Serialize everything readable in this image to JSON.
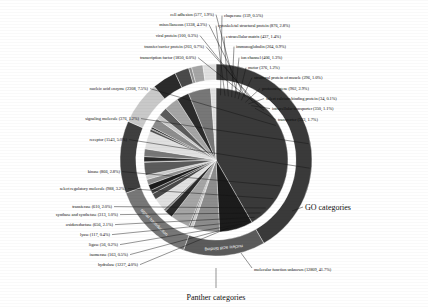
{
  "figure": {
    "title": "",
    "inner_ring_caption": "Panther categories",
    "outer_ring_caption": "GO categories",
    "unknown_caption": "molecular function unknown (12809, 41.7%)"
  },
  "chart_data": {
    "type": "pie",
    "title": "",
    "subtitle": "",
    "xlabel": "",
    "ylabel": "",
    "legend_position": "callout-labels",
    "grid": false,
    "rings": [
      {
        "name": "Panther categories",
        "radius_inner": 0,
        "radius_outer": 96,
        "note": "inner pie - Panther molecular function categories"
      },
      {
        "name": "GO categories",
        "radius_inner": 104,
        "radius_outer": 126,
        "note": "outer ring - Gene Ontology roll-up categories"
      }
    ],
    "categories": [
      "molecular function unknown",
      "nucleic acid enzyme",
      "transcription factor",
      "transfer/carrier protein",
      "viral protein",
      "miscellaneous",
      "cell adhesion",
      "chaperone",
      "cytoskeletal structural protein",
      "extracellular matrix",
      "immunoglobulin",
      "ion channel",
      "motor",
      "structural protein of muscle",
      "protooncogene",
      "select calcium binding protein",
      "intracellular transporter",
      "transporter",
      "hydrolase",
      "isomerase",
      "ligase",
      "lyase",
      "oxidoreductase",
      "synthase and synthetase",
      "transferase",
      "select regulatory molecule",
      "kinase",
      "receptor",
      "signaling molecule"
    ],
    "values": [
      12809,
      2308,
      1850,
      203,
      100,
      1338,
      577,
      159,
      876,
      437,
      264,
      406,
      376,
      296,
      902,
      34,
      350,
      533,
      1227,
      163,
      56,
      117,
      656,
      313,
      610,
      988,
      866,
      1543,
      376
    ],
    "percents": [
      41.7,
      7.5,
      6.0,
      0.7,
      0.3,
      4.3,
      1.9,
      0.5,
      2.8,
      1.4,
      0.9,
      1.3,
      1.2,
      1.0,
      2.9,
      0.1,
      1.1,
      1.7,
      4.0,
      0.5,
      0.2,
      0.4,
      2.1,
      1.0,
      2.0,
      3.2,
      2.8,
      5.0,
      1.2
    ],
    "total": 30733,
    "outer_ring_segments": [
      {
        "label": "molecular function unknown",
        "percent": 41.7
      },
      {
        "label": "nucleic acid binding",
        "percent": 13.8
      },
      {
        "label": "signal transduction",
        "percent": 13.9
      },
      {
        "label": "enzyme",
        "percent": 12.2
      },
      {
        "label": "structural molecule",
        "percent": 7.3
      },
      {
        "label": "transporter",
        "percent": 4.1
      },
      {
        "label": "defense/immunity",
        "percent": 2.4
      },
      {
        "label": "chaperone",
        "percent": 0.5
      },
      {
        "label": "cell adhesion",
        "percent": 1.9
      },
      {
        "label": "miscellaneous",
        "percent": 2.2
      }
    ]
  },
  "labels": {
    "left": [
      {
        "id": "cell-adhesion",
        "text": "cell adhesion (577, 1.9%)"
      },
      {
        "id": "miscellaneous",
        "text": "miscellaneous (1338, 4.3%)"
      },
      {
        "id": "viral-protein",
        "text": "viral protein (100, 0.3%)"
      },
      {
        "id": "transfer-carrier-protein",
        "text": "transfer/carrier protein (203, 0.7%)"
      },
      {
        "id": "transcription-factor",
        "text": "transcription factor (1850, 6.0%)"
      },
      {
        "id": "nucleic-acid-enzyme",
        "text": "nucleic acid enzyme (2308, 7.5%)"
      },
      {
        "id": "signaling-molecule",
        "text": "signaling molecule (376, 1.2%)"
      },
      {
        "id": "receptor",
        "text": "receptor (1543, 5.0%)"
      },
      {
        "id": "kinase",
        "text": "kinase (866, 2.8%)"
      },
      {
        "id": "select-regulatory-molecule",
        "text": "select regulatory molecule (988, 3.2%)"
      },
      {
        "id": "transferase",
        "text": "transferase (610, 2.0%)"
      },
      {
        "id": "synthase-and-synthetase",
        "text": "synthase and synthetase (313, 1.0%)"
      },
      {
        "id": "oxidoreductase",
        "text": "oxidoreductase (656, 2.1%)"
      },
      {
        "id": "lyase",
        "text": "lyase (117, 0.4%)"
      },
      {
        "id": "ligase",
        "text": "ligase (56, 0.2%)"
      },
      {
        "id": "isomerase",
        "text": "isomerase (163, 0.5%)"
      },
      {
        "id": "hydrolase",
        "text": "hydrolase (1227, 4.0%)"
      }
    ],
    "right": [
      {
        "id": "chaperone",
        "text": "chaperone (159, 0.5%)"
      },
      {
        "id": "cytoskeletal-structural-protein",
        "text": "cytoskeletal structural protein (876, 2.8%)"
      },
      {
        "id": "extracellular-matrix",
        "text": "extracellular matrix (437, 1.4%)"
      },
      {
        "id": "immunoglobulin",
        "text": "immunoglobulin (264, 0.9%)"
      },
      {
        "id": "ion-channel",
        "text": "ion channel (406, 1.3%)"
      },
      {
        "id": "motor",
        "text": "motor (376, 1.2%)"
      },
      {
        "id": "structural-protein-of-muscle",
        "text": "structural protein of muscle (296, 1.0%)"
      },
      {
        "id": "protooncogene",
        "text": "protooncogene (902, 2.9%)"
      },
      {
        "id": "select-calcium-binding-protein",
        "text": "select calcium binding protein (34, 0.1%)"
      },
      {
        "id": "intracellular-transporter",
        "text": "intracellular transporter (350, 1.1%)"
      },
      {
        "id": "transporter",
        "text": "transporter (533, 1.7%)"
      }
    ],
    "ring_text": [
      {
        "id": "ring-nucleic-acid-binding",
        "text": "nucleic acid binding"
      },
      {
        "id": "ring-signal-transduction",
        "text": "signal transduction"
      }
    ]
  },
  "colors": {
    "background": "#ffffff",
    "text": "#111111",
    "gap": "#ffffff",
    "dark": "#3a3a3a",
    "mid": "#6f6f6f",
    "light": "#b9b9b9",
    "black": "#1a1a1a",
    "palette": [
      "#3f3f3f",
      "#1c1c1c",
      "#8d8d8d",
      "#c9c9c9",
      "#5b5b5b",
      "#a5a5a5",
      "#2b2b2b",
      "#777777",
      "#e0e0e0",
      "#4a4a4a"
    ]
  }
}
